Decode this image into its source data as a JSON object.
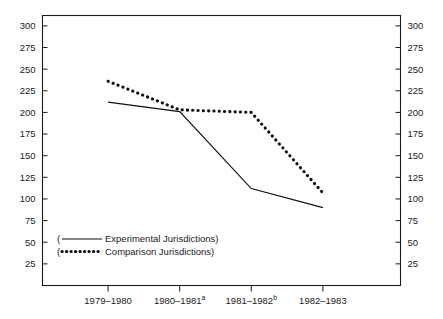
{
  "chart_data": {
    "type": "line",
    "title": "",
    "subtitle": "",
    "xlabel": "",
    "ylabel": "",
    "categories": [
      "1979–1980",
      "1980–1981",
      "1981–1982",
      "1982–1983"
    ],
    "category_footnotes": [
      "",
      "a",
      "b",
      ""
    ],
    "series": [
      {
        "name": "Experimental Jurisdictions",
        "style": "solid",
        "values": [
          212,
          201,
          112,
          90
        ]
      },
      {
        "name": "Comparison Jurisdictions",
        "style": "dotted",
        "values": [
          236,
          203,
          200,
          107
        ]
      }
    ],
    "ylim": [
      0,
      312
    ],
    "y_ticks": [
      25,
      50,
      75,
      100,
      125,
      150,
      175,
      200,
      225,
      250,
      275,
      300
    ],
    "y_ticks_right": [
      25,
      50,
      75,
      100,
      125,
      150,
      175,
      200,
      225,
      250,
      275,
      300
    ],
    "grid": false,
    "legend_position": "inside-bottom-left",
    "axis_color": "#1a1a1a",
    "series_color": "#101010"
  },
  "legend": {
    "open_paren": "(",
    "close_paren": ")",
    "entries": [
      {
        "label": "Experimental Jurisdictions",
        "style": "solid"
      },
      {
        "label": "Comparison Jurisdictions",
        "style": "dotted"
      }
    ]
  },
  "axes": {
    "left": {
      "labels": [
        "300",
        "275",
        "250",
        "225",
        "200",
        "175",
        "150",
        "125",
        "100",
        "75",
        "50",
        "25"
      ]
    },
    "right": {
      "labels": [
        "300",
        "275",
        "250",
        "225",
        "200",
        "175",
        "150",
        "125",
        "100",
        "75",
        "50",
        "25"
      ]
    },
    "bottom": {
      "labels": [
        "1979–1980",
        "1980–1981",
        "1981–1982",
        "1982–1983"
      ],
      "superscripts": [
        "",
        "a",
        "b",
        ""
      ]
    }
  }
}
